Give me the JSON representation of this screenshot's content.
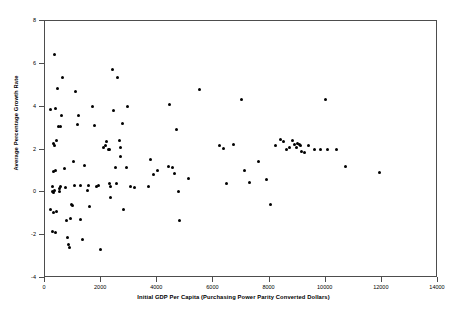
{
  "chart_data": {
    "type": "scatter",
    "title": "",
    "xlabel": "Initial GDP Per Capita (Purchasing Power Parity Converted Dollars)",
    "ylabel": "Average Percentage Growth Rate",
    "xlim": [
      0,
      14000
    ],
    "ylim": [
      -4,
      8
    ],
    "xticks": [
      0,
      2000,
      4000,
      6000,
      8000,
      10000,
      12000,
      14000
    ],
    "xtick_labels": [
      "0",
      "2000",
      "4000",
      "6000",
      "8000",
      "10000",
      "12000",
      "14000"
    ],
    "yticks": [
      -4,
      -2,
      0,
      2,
      4,
      6,
      8
    ],
    "ytick_labels": [
      "-4",
      "-2",
      "0",
      "2",
      "4",
      "6",
      "8"
    ],
    "grid": false,
    "legend": null,
    "marker": {
      "shape": "circle",
      "color": "#000000",
      "size": 3
    },
    "frame_color": "#4d4d4d",
    "background": "#ffffff",
    "series": [
      {
        "name": "Countries",
        "points": [
          [
            180,
            3.88
          ],
          [
            330,
            6.42
          ],
          [
            360,
            3.92
          ],
          [
            300,
            2.28
          ],
          [
            420,
            2.42
          ],
          [
            350,
            2.18
          ],
          [
            390,
            1.02
          ],
          [
            300,
            0.95
          ],
          [
            250,
            0.28
          ],
          [
            255,
            0.02
          ],
          [
            300,
            0.0
          ],
          [
            330,
            0.1
          ],
          [
            200,
            -0.82
          ],
          [
            250,
            -1.82
          ],
          [
            310,
            -0.92
          ],
          [
            360,
            -1.88
          ],
          [
            420,
            -0.88
          ],
          [
            460,
            4.86
          ],
          [
            480,
            3.08
          ],
          [
            560,
            3.06
          ],
          [
            520,
            0.18
          ],
          [
            530,
            0.05
          ],
          [
            560,
            0.28
          ],
          [
            600,
            3.6
          ],
          [
            640,
            5.38
          ],
          [
            700,
            1.1
          ],
          [
            720,
            0.22
          ],
          [
            760,
            -1.32
          ],
          [
            800,
            -2.12
          ],
          [
            840,
            -2.42
          ],
          [
            860,
            -2.58
          ],
          [
            900,
            -1.22
          ],
          [
            950,
            -0.55
          ],
          [
            980,
            -0.62
          ],
          [
            1000,
            1.42
          ],
          [
            1050,
            0.32
          ],
          [
            1100,
            4.7
          ],
          [
            1150,
            3.18
          ],
          [
            1200,
            3.58
          ],
          [
            1250,
            0.3
          ],
          [
            1280,
            -1.28
          ],
          [
            1350,
            -2.22
          ],
          [
            1420,
            1.25
          ],
          [
            1500,
            0.08
          ],
          [
            1560,
            0.3
          ],
          [
            1600,
            -0.68
          ],
          [
            1700,
            4.0
          ],
          [
            1760,
            3.1
          ],
          [
            1820,
            0.28
          ],
          [
            1900,
            0.3
          ],
          [
            1980,
            -2.68
          ],
          [
            2100,
            2.1
          ],
          [
            2150,
            2.18
          ],
          [
            2200,
            2.38
          ],
          [
            2250,
            2.02
          ],
          [
            2280,
            1.98
          ],
          [
            2300,
            0.4
          ],
          [
            2320,
            0.25
          ],
          [
            2350,
            -0.22
          ],
          [
            2400,
            5.72
          ],
          [
            2450,
            3.8
          ],
          [
            2500,
            1.15
          ],
          [
            2550,
            0.42
          ],
          [
            2600,
            5.35
          ],
          [
            2650,
            2.4
          ],
          [
            2680,
            1.68
          ],
          [
            2700,
            2.1
          ],
          [
            2750,
            3.22
          ],
          [
            2800,
            -0.8
          ],
          [
            2900,
            1.18
          ],
          [
            2950,
            4.02
          ],
          [
            3050,
            0.28
          ],
          [
            3200,
            0.22
          ],
          [
            3700,
            0.28
          ],
          [
            3750,
            1.52
          ],
          [
            3850,
            0.82
          ],
          [
            4000,
            1.02
          ],
          [
            4400,
            1.22
          ],
          [
            4450,
            4.08
          ],
          [
            4550,
            1.18
          ],
          [
            4620,
            0.88
          ],
          [
            4700,
            2.95
          ],
          [
            4750,
            0.02
          ],
          [
            4800,
            -1.3
          ],
          [
            5100,
            0.65
          ],
          [
            5500,
            4.8
          ],
          [
            6200,
            2.18
          ],
          [
            6350,
            2.05
          ],
          [
            6450,
            0.42
          ],
          [
            6700,
            2.22
          ],
          [
            7000,
            4.35
          ],
          [
            7100,
            1.0
          ],
          [
            7300,
            0.48
          ],
          [
            7600,
            1.42
          ],
          [
            7900,
            0.62
          ],
          [
            8050,
            -0.58
          ],
          [
            8200,
            2.18
          ],
          [
            8400,
            2.45
          ],
          [
            8500,
            2.38
          ],
          [
            8600,
            1.98
          ],
          [
            8700,
            2.1
          ],
          [
            8800,
            2.42
          ],
          [
            8900,
            2.22
          ],
          [
            8950,
            2.08
          ],
          [
            9000,
            2.28
          ],
          [
            9050,
            2.25
          ],
          [
            9100,
            2.18
          ],
          [
            9150,
            1.92
          ],
          [
            9250,
            1.88
          ],
          [
            9400,
            2.18
          ],
          [
            9600,
            2.0
          ],
          [
            9800,
            2.02
          ],
          [
            10000,
            4.32
          ],
          [
            10050,
            2.0
          ],
          [
            10400,
            1.98
          ],
          [
            10700,
            1.2
          ],
          [
            11900,
            0.92
          ]
        ]
      }
    ]
  }
}
